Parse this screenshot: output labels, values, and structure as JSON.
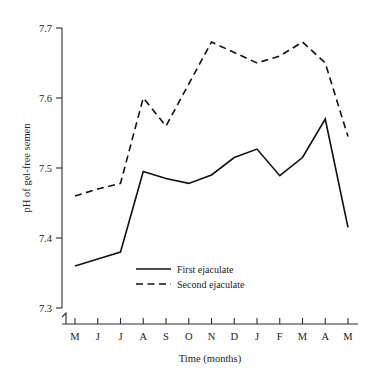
{
  "chart_data": {
    "type": "line",
    "title": "",
    "xlabel": "Time (months)",
    "ylabel": "pH of gel-free semen",
    "categories": [
      "M",
      "J",
      "J",
      "A",
      "S",
      "O",
      "N",
      "D",
      "J",
      "F",
      "M",
      "A",
      "M"
    ],
    "ylim": [
      7.3,
      7.7
    ],
    "yticks": [
      "7.3",
      "7.4",
      "7.5",
      "7.6",
      "7.7"
    ],
    "ytick_values": [
      7.3,
      7.4,
      7.5,
      7.6,
      7.7
    ],
    "grid": false,
    "legend_position": "inside-bottom-center",
    "axis_break": true,
    "series": [
      {
        "name": "First ejaculate",
        "style": "solid",
        "color": "#111111",
        "values": [
          7.36,
          7.37,
          7.38,
          7.495,
          7.485,
          7.478,
          7.49,
          7.515,
          7.527,
          7.489,
          7.515,
          7.57,
          7.415
        ]
      },
      {
        "name": "Second ejaculate",
        "style": "dashed",
        "color": "#111111",
        "values": [
          7.46,
          7.47,
          7.478,
          7.6,
          7.56,
          7.62,
          7.68,
          7.665,
          7.65,
          7.66,
          7.68,
          7.65,
          7.545
        ]
      }
    ]
  },
  "legend": {
    "items": [
      {
        "label": "First ejaculate",
        "style": "solid"
      },
      {
        "label": "Second ejaculate",
        "style": "dashed"
      }
    ]
  }
}
